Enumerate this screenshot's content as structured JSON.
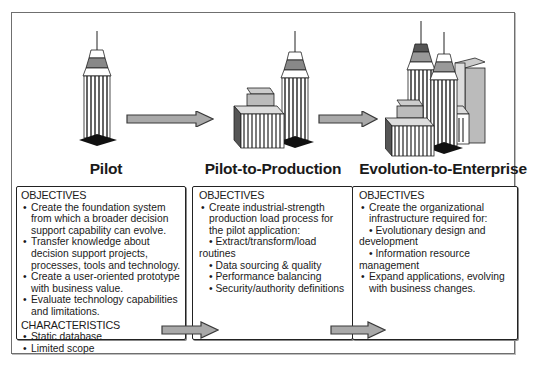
{
  "stages": [
    {
      "title": "Pilot",
      "illustration": "single-skyscraper-icon",
      "box": {
        "sections": [
          {
            "heading": "OBJECTIVES",
            "items": [
              "Create the foundation system from which a broader decision support capability can evolve.",
              "Transfer knowledge about decision support projects, processes, tools and technology.",
              "Create a user-oriented prototype with business value.",
              "Evaluate technology capabilities and limitations."
            ]
          },
          {
            "heading": "CHARACTERISTICS",
            "items": [
              "Static database",
              "Limited scope"
            ]
          }
        ]
      }
    },
    {
      "title": "Pilot-to-Production",
      "illustration": "skyscraper-with-low-building-icon",
      "box": {
        "sections": [
          {
            "heading": "OBJECTIVES",
            "items": [
              "Create industrial-strength production load process for the pilot application:"
            ],
            "subitems": [
              "Extract/transform/load routines",
              "Data sourcing & quality",
              "Performance balancing",
              "Security/authority definitions"
            ]
          }
        ]
      }
    },
    {
      "title": "Evolution-to-Enterprise",
      "illustration": "city-cluster-icon",
      "box": {
        "sections": [
          {
            "heading": "OBJECTIVES",
            "items": [
              "Create the organizational infrastructure required for:"
            ],
            "subitems": [
              "Evolutionary design and development",
              "Information resource management"
            ],
            "items_after": [
              "Expand applications, evolving with business changes."
            ]
          }
        ]
      }
    }
  ],
  "colors": {
    "arrow_fill": "#a9a9a9",
    "arrow_stroke": "#3a3a3a",
    "box_border": "#222222",
    "frame_border": "#6f6f6f"
  }
}
